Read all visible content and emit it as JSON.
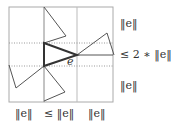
{
  "diagram": {
    "edge_label": "e",
    "right_labels": [
      "‖e‖",
      "≤ 2 ∗ ‖e‖",
      "‖e‖"
    ],
    "bottom_labels": [
      "‖e‖",
      "≤ ‖e‖",
      "‖e‖"
    ],
    "colors": {
      "box": "#aaaaaa",
      "triangle": "#555555",
      "bold": "#333333",
      "dotted": "#999999"
    }
  }
}
